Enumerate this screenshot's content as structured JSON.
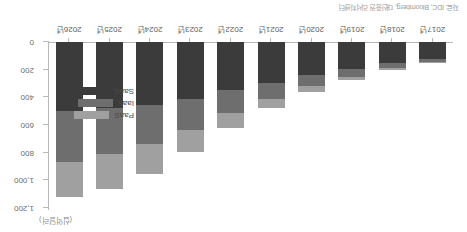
{
  "source_note": "자료: IDC, Bloomberg, 대신증권 리서치센터",
  "unit_label": "(십억달러)",
  "legend": {
    "items": [
      {
        "key": "saas",
        "label": "SaaS",
        "color": "#3b3b3b"
      },
      {
        "key": "iaas",
        "label": "IaaS",
        "color": "#6e6e6e"
      },
      {
        "key": "paas",
        "label": "PaaS",
        "color": "#a0a0a0"
      }
    ]
  },
  "chart_data": {
    "type": "bar",
    "stacked": true,
    "orientation": "vertical",
    "title": "",
    "subtitle": "",
    "xlabel": "",
    "ylabel": "(십억달러)",
    "ylim": [
      0,
      1200
    ],
    "yticks": [
      0,
      200,
      400,
      600,
      800,
      1000,
      1200
    ],
    "ytick_labels": [
      "0",
      "200",
      "400",
      "600",
      "800",
      "1,000",
      "1,200"
    ],
    "grid": false,
    "legend_position": "bottom-right",
    "categories": [
      "2017년",
      "2018년",
      "2019년",
      "2020년",
      "2021년",
      "2022년",
      "2023년",
      "2024년",
      "2025년",
      "2026년"
    ],
    "series": [
      {
        "name": "SaaS",
        "color": "#3b3b3b",
        "values": [
          120,
          150,
          195,
          240,
          295,
          350,
          410,
          455,
          480,
          500
        ]
      },
      {
        "name": "IaaS",
        "color": "#6e6e6e",
        "values": [
          25,
          35,
          55,
          80,
          115,
          165,
          225,
          285,
          330,
          370
        ]
      },
      {
        "name": "PaaS",
        "color": "#a0a0a0",
        "values": [
          10,
          15,
          25,
          40,
          65,
          105,
          160,
          215,
          250,
          250
        ]
      }
    ],
    "totals": [
      155,
      200,
      275,
      360,
      475,
      620,
      795,
      955,
      1060,
      1120
    ]
  }
}
